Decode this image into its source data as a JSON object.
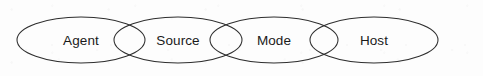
{
  "diagram": {
    "type": "overlapping-ellipse-chain",
    "orientation": "horizontal",
    "background_color": "#fdfdfd",
    "stroke_color": "#2e2e2e",
    "text_color": "#1a1a1a",
    "nodes": [
      {
        "id": "agent",
        "label": "Agent",
        "cx": 81,
        "cy": 40,
        "rx": 64,
        "ry": 23
      },
      {
        "id": "source",
        "label": "Source",
        "cx": 178,
        "cy": 40,
        "rx": 64,
        "ry": 23
      },
      {
        "id": "mode",
        "label": "Mode",
        "cx": 274,
        "cy": 40,
        "rx": 64,
        "ry": 23
      },
      {
        "id": "host",
        "label": "Host",
        "cx": 374,
        "cy": 40,
        "rx": 64,
        "ry": 23
      }
    ],
    "overlaps": [
      {
        "between": [
          "agent",
          "source"
        ],
        "center_x": 122
      },
      {
        "between": [
          "source",
          "mode"
        ],
        "center_x": 222
      },
      {
        "between": [
          "mode",
          "host"
        ],
        "center_x": 318
      }
    ]
  }
}
